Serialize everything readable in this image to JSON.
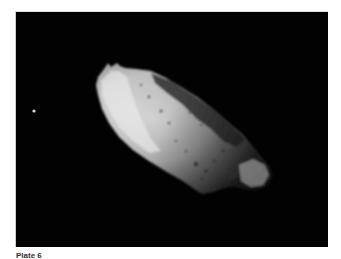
{
  "header": {
    "faint_text": ""
  },
  "figure": {
    "background_color": "#020202",
    "asteroid_highlight_color": "#e8e8e8",
    "asteroid_shadow_color": "#3a3a3a"
  },
  "caption": {
    "label": "Plate 6"
  }
}
